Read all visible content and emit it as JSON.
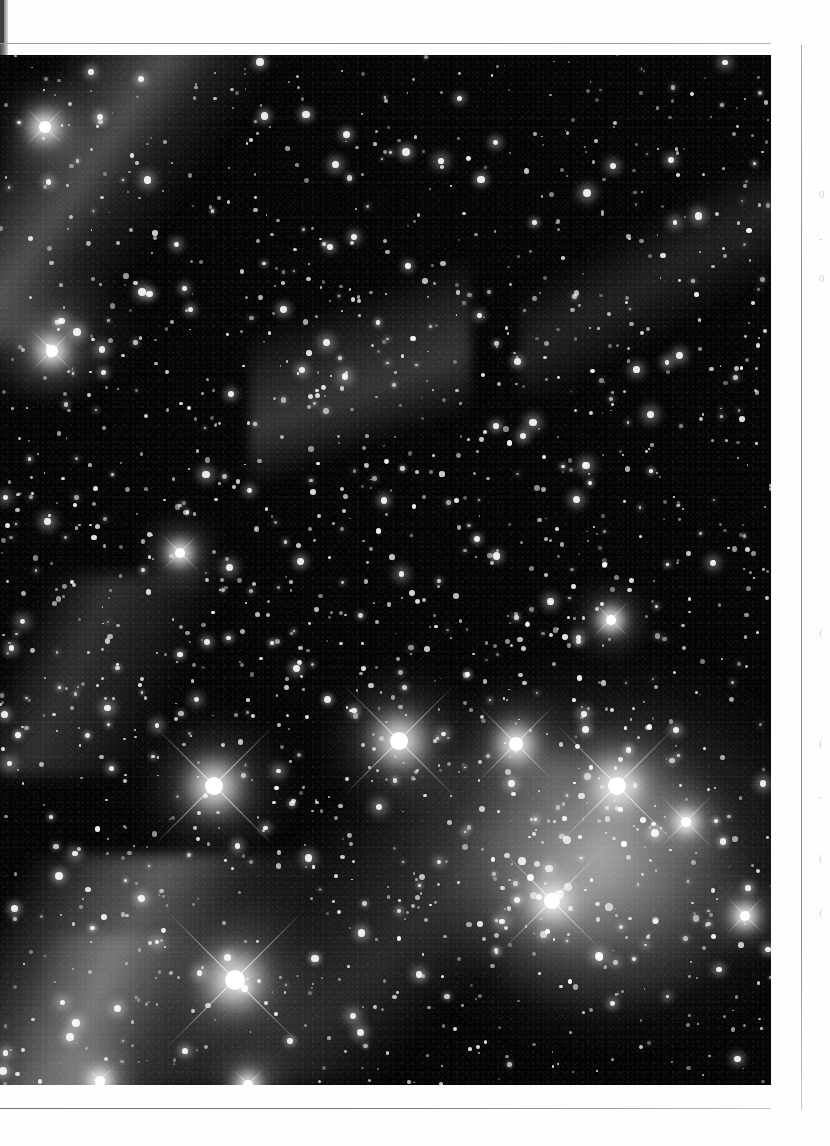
{
  "page": {
    "kind": "scanned-book-page",
    "background_color": "#fefefe",
    "width": 830,
    "height": 1146
  },
  "rules": {
    "top_rule_color": "#8d8d8d",
    "bottom_rule_color": "#7c7c7c",
    "column_rule_color": "#8e8e8e"
  },
  "figure": {
    "name": "star-cluster-photograph",
    "type": "grayscale astronomical photograph",
    "background_color": "#050506",
    "bright_stars": [
      {
        "x": 214,
        "y": 731,
        "r": 9,
        "spike": 86
      },
      {
        "x": 399,
        "y": 686,
        "r": 9,
        "spike": 80
      },
      {
        "x": 516,
        "y": 689,
        "r": 7,
        "spike": 54
      },
      {
        "x": 617,
        "y": 731,
        "r": 9,
        "spike": 84
      },
      {
        "x": 552,
        "y": 846,
        "r": 8,
        "spike": 70
      },
      {
        "x": 235,
        "y": 925,
        "r": 10,
        "spike": 96
      },
      {
        "x": 686,
        "y": 767,
        "r": 5,
        "spike": 38
      },
      {
        "x": 45,
        "y": 72,
        "r": 6,
        "spike": 26
      },
      {
        "x": 52,
        "y": 296,
        "r": 6,
        "spike": 30
      },
      {
        "x": 180,
        "y": 498,
        "r": 5,
        "spike": 28
      },
      {
        "x": 611,
        "y": 565,
        "r": 5,
        "spike": 26
      },
      {
        "x": 745,
        "y": 861,
        "r": 5,
        "spike": 26
      },
      {
        "x": 100,
        "y": 1026,
        "r": 5,
        "spike": 22
      },
      {
        "x": 248,
        "y": 1030,
        "r": 5,
        "spike": 22
      }
    ]
  },
  "margin_fragments": [
    {
      "text": "0",
      "top": 188
    },
    {
      "text": "-",
      "top": 232
    },
    {
      "text": "0",
      "top": 272
    },
    {
      "text": "(",
      "top": 626
    },
    {
      "text": "(",
      "top": 737
    },
    {
      "text": "-",
      "top": 790
    },
    {
      "text": "(",
      "top": 852
    },
    {
      "text": "(",
      "top": 906
    }
  ]
}
